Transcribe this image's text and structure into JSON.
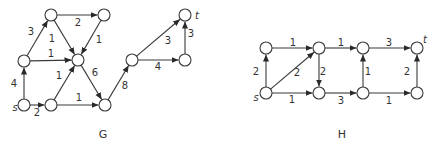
{
  "style": {
    "line_color": "#3a3a3a",
    "node_fill": "#ffffff",
    "text_color": "#333333",
    "node_radius": 6
  },
  "graphs": [
    {
      "id": "G",
      "caption": "G",
      "caption_pos": [
        103,
        138
      ],
      "nodes": [
        {
          "id": "s",
          "x": 24,
          "y": 105,
          "label": "s",
          "label_pos": [
            15,
            111
          ]
        },
        {
          "id": "b",
          "x": 24,
          "y": 61
        },
        {
          "id": "a",
          "x": 51,
          "y": 15
        },
        {
          "id": "d",
          "x": 104,
          "y": 15
        },
        {
          "id": "x",
          "x": 78,
          "y": 60
        },
        {
          "id": "c",
          "x": 51,
          "y": 105
        },
        {
          "id": "y",
          "x": 105,
          "y": 105
        },
        {
          "id": "m",
          "x": 132,
          "y": 60
        },
        {
          "id": "r",
          "x": 185,
          "y": 60
        },
        {
          "id": "t",
          "x": 185,
          "y": 15,
          "label": "t",
          "label_pos": [
            197,
            19
          ]
        }
      ],
      "edges": [
        {
          "from": "s",
          "to": "b",
          "weight": "4",
          "label_pos": [
            14,
            87
          ]
        },
        {
          "from": "s",
          "to": "c",
          "weight": "2",
          "label_pos": [
            37,
            116
          ]
        },
        {
          "from": "b",
          "to": "a",
          "weight": "3",
          "label_pos": [
            31,
            35
          ]
        },
        {
          "from": "b",
          "to": "x",
          "weight": "1",
          "label_pos": [
            51,
            57
          ]
        },
        {
          "from": "a",
          "to": "d",
          "weight": "2",
          "label_pos": [
            78,
            26
          ]
        },
        {
          "from": "a",
          "to": "x",
          "weight": "1",
          "label_pos": [
            52,
            42
          ]
        },
        {
          "from": "d",
          "to": "x",
          "weight": "1",
          "label_pos": [
            99,
            43
          ]
        },
        {
          "from": "c",
          "to": "x",
          "weight": "1",
          "label_pos": [
            59,
            79
          ]
        },
        {
          "from": "c",
          "to": "y",
          "weight": "1",
          "label_pos": [
            79,
            101
          ]
        },
        {
          "from": "x",
          "to": "y",
          "weight": "6",
          "label_pos": [
            95,
            76
          ]
        },
        {
          "from": "y",
          "to": "m",
          "weight": "8",
          "label_pos": [
            125,
            89
          ]
        },
        {
          "from": "m",
          "to": "t",
          "weight": "3",
          "label_pos": [
            168,
            44
          ]
        },
        {
          "from": "m",
          "to": "r",
          "weight": "4",
          "label_pos": [
            158,
            70
          ]
        },
        {
          "from": "r",
          "to": "t",
          "weight": "3",
          "label_pos": [
            191,
            37
          ]
        }
      ]
    },
    {
      "id": "H",
      "caption": "H",
      "caption_pos": [
        342,
        138
      ],
      "nodes": [
        {
          "id": "s",
          "x": 266,
          "y": 93,
          "label": "s",
          "label_pos": [
            256,
            101
          ]
        },
        {
          "id": "a",
          "x": 266,
          "y": 48
        },
        {
          "id": "b",
          "x": 319,
          "y": 48
        },
        {
          "id": "c",
          "x": 319,
          "y": 93
        },
        {
          "id": "d",
          "x": 363,
          "y": 48
        },
        {
          "id": "e",
          "x": 363,
          "y": 93
        },
        {
          "id": "t",
          "x": 417,
          "y": 48,
          "label": "t",
          "label_pos": [
            425,
            43
          ]
        },
        {
          "id": "f",
          "x": 417,
          "y": 93
        }
      ],
      "edges": [
        {
          "from": "s",
          "to": "a",
          "weight": "2",
          "label_pos": [
            256,
            75
          ]
        },
        {
          "from": "s",
          "to": "b",
          "weight": "2",
          "label_pos": [
            297,
            76
          ]
        },
        {
          "from": "s",
          "to": "c",
          "weight": "1",
          "label_pos": [
            292,
            103
          ]
        },
        {
          "from": "a",
          "to": "b",
          "weight": "1",
          "label_pos": [
            293,
            46
          ]
        },
        {
          "from": "b",
          "to": "c",
          "weight": "2",
          "label_pos": [
            323,
            75
          ]
        },
        {
          "from": "b",
          "to": "d",
          "weight": "1",
          "label_pos": [
            341,
            46
          ]
        },
        {
          "from": "c",
          "to": "e",
          "weight": "3",
          "label_pos": [
            341,
            104
          ]
        },
        {
          "from": "e",
          "to": "d",
          "weight": "1",
          "label_pos": [
            368,
            75
          ]
        },
        {
          "from": "d",
          "to": "t",
          "weight": "3",
          "label_pos": [
            389,
            46
          ]
        },
        {
          "from": "e",
          "to": "f",
          "weight": "1",
          "label_pos": [
            389,
            104
          ]
        },
        {
          "from": "f",
          "to": "t",
          "weight": "2",
          "label_pos": [
            407,
            75
          ]
        }
      ]
    }
  ]
}
